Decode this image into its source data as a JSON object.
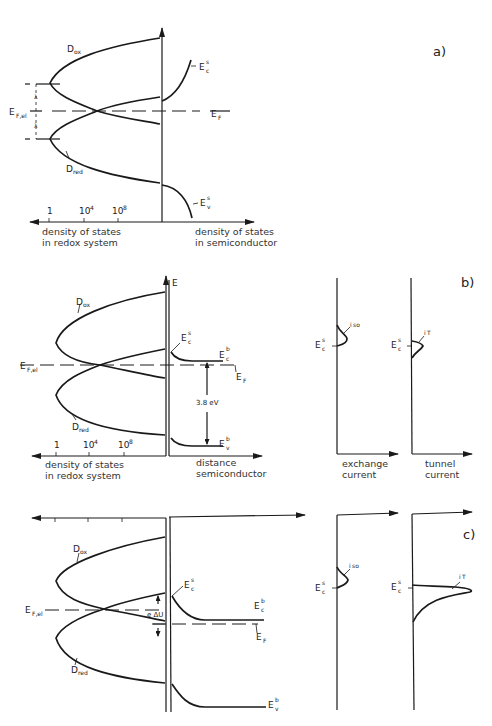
{
  "panels": {
    "a": {
      "label": "a)",
      "d_ox": "D",
      "d_ox_sub": "ox",
      "d_red": "D",
      "d_red_sub": "red",
      "ec_s": "E",
      "ec_s_sub": "c",
      "ec_s_sup": "s",
      "ev_s": "E",
      "ev_s_sub": "v",
      "ev_s_sup": "s",
      "ef": "E",
      "ef_sub": "F",
      "ef_el": "E",
      "ef_el_sub": "F,el",
      "lambda_top": "λ",
      "lambda_bottom": "λ",
      "ticks": [
        "1",
        "10",
        "10"
      ],
      "tick_exps": [
        "",
        "4",
        "8"
      ],
      "caption_left_1": "density of states",
      "caption_left_2": "in redox system",
      "caption_right_1": "density of states",
      "caption_right_2": "in semiconductor"
    },
    "b": {
      "label": "b)",
      "axis_e": "E",
      "d_ox": "D",
      "d_ox_sub": "ox",
      "d_red": "D",
      "d_red_sub": "red",
      "ec_s": "E",
      "ec_s_sub": "c",
      "ec_s_sup": "s",
      "ec_b": "E",
      "ec_b_sub": "c",
      "ec_b_sup": "b",
      "ev_b": "E",
      "ev_b_sub": "v",
      "ev_b_sup": "b",
      "ef": "E",
      "ef_sub": "F",
      "ef_el": "E",
      "ef_el_sub": "F,el",
      "gap": "3.8 eV",
      "ticks": [
        "1",
        "10",
        "10"
      ],
      "tick_exps": [
        "",
        "4",
        "8"
      ],
      "caption_left_1": "density of states",
      "caption_left_2": "in redox system",
      "caption_mid_1": "distance",
      "caption_mid_2": "semiconductor",
      "exchange": {
        "ec_s": "E",
        "ec_s_sub": "c",
        "ec_s_sup": "s",
        "curve": "i",
        "curve_sub": "so",
        "caption_1": "exchange",
        "caption_2": "current"
      },
      "tunnel": {
        "ec_s": "E",
        "ec_s_sub": "c",
        "ec_s_sup": "s",
        "curve": "i",
        "curve_sub": "T",
        "caption_1": "tunnel",
        "caption_2": "current"
      }
    },
    "c": {
      "label": "c)",
      "d_ox": "D",
      "d_ox_sub": "ox",
      "d_red": "D",
      "d_red_sub": "red",
      "ec_s": "E",
      "ec_s_sub": "c",
      "ec_s_sup": "s",
      "ec_b": "E",
      "ec_b_sub": "c",
      "ec_b_sup": "b",
      "ev_b": "E",
      "ev_b_sub": "v",
      "ev_b_sup": "b",
      "ef": "E",
      "ef_sub": "F",
      "ef_el": "E",
      "ef_el_sub": "F,el",
      "delta_u": "e ΔU",
      "exchange": {
        "ec_s": "E",
        "ec_s_sub": "c",
        "ec_s_sup": "s",
        "curve": "i",
        "curve_sub": "so"
      },
      "tunnel": {
        "ec_s": "E",
        "ec_s_sub": "c",
        "ec_s_sup": "s",
        "curve": "i",
        "curve_sub": "T"
      }
    }
  }
}
